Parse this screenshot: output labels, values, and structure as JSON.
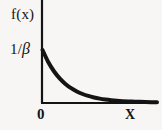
{
  "figure": {
    "background_color": "#f7f6f4",
    "ink_color": "#141414",
    "width": 162,
    "height": 130
  },
  "labels": {
    "y_axis": "f(x)",
    "y_tick_prefix": "1/",
    "y_tick_symbol": "β",
    "origin": "0",
    "x_axis": "X"
  },
  "chart_data": {
    "type": "line",
    "title": "",
    "subtitle": "",
    "xlabel": "X",
    "ylabel": "f(x)",
    "legend": [],
    "legend_position": "none",
    "grid": false,
    "annotations": [
      {
        "text": "1/β",
        "axis": "y",
        "value": 1.0,
        "note": "y-intercept tick label, peak density at x=0"
      },
      {
        "text": "0",
        "axis": "x",
        "value": 0.0,
        "note": "origin label below axis"
      }
    ],
    "axis_ranges": {
      "xlim": [
        0,
        5.2
      ],
      "ylim": [
        0,
        1.45
      ]
    },
    "tick_labels": {
      "x": [
        "0"
      ],
      "y": [
        "1/β"
      ]
    },
    "series": [
      {
        "name": "Exponential probability density function",
        "equation": "f(x) = (1/β) e^(-x/β)",
        "x": [
          0,
          0.26,
          0.52,
          0.78,
          1.04,
          1.3,
          1.56,
          1.82,
          2.08,
          2.34,
          2.6,
          2.86,
          3.12,
          3.38,
          3.64,
          3.9,
          4.16,
          4.42,
          4.68,
          4.94,
          5.2
        ],
        "y": [
          1.0,
          0.771,
          0.595,
          0.458,
          0.354,
          0.273,
          0.21,
          0.162,
          0.125,
          0.096,
          0.074,
          0.057,
          0.044,
          0.034,
          0.026,
          0.02,
          0.016,
          0.012,
          0.009,
          0.007,
          0.006
        ],
        "color": "#141414",
        "line_width": 4
      }
    ]
  }
}
